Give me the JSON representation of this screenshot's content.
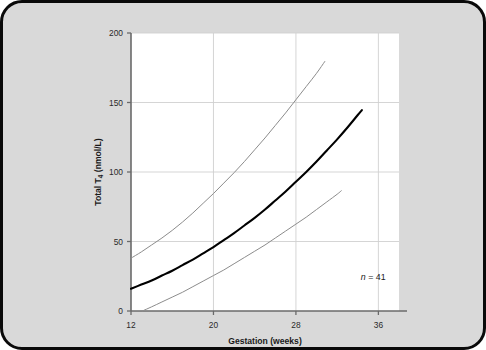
{
  "figure": {
    "background_color": "#d9d9d9",
    "border_color": "#0a0a0a",
    "plot_background_color": "#ffffff"
  },
  "chart_data": {
    "type": "line",
    "title": "",
    "xlabel": "Gestation (weeks)",
    "ylabel_prefix": "Total T",
    "ylabel_sub": "4",
    "ylabel_suffix": " (nmol/L)",
    "ylabel": "Total T4 (nmol/L)",
    "xlim": [
      12,
      38
    ],
    "ylim": [
      0,
      200
    ],
    "xticks": [
      12,
      20,
      28,
      36
    ],
    "xticklabels": [
      "12",
      "20",
      "28",
      "36"
    ],
    "yticks": [
      0,
      50,
      100,
      150,
      200
    ],
    "yticklabels": [
      "0",
      "50",
      "100",
      "150",
      "200"
    ],
    "grid": true,
    "grid_color": "#d0d0d0",
    "legend": "none",
    "annotations": [
      {
        "name": "sample-size",
        "text_italic": "n",
        "text_rest": " = 41",
        "x": 35.5,
        "y": 22
      }
    ],
    "series": [
      {
        "name": "upper-centile",
        "label": "Upper reference limit (97.5th centile)",
        "color": "#8c8c8c",
        "width": 1.0,
        "points": [
          {
            "x": 12.0,
            "y": 38.0
          },
          {
            "x": 13.0,
            "y": 42.5
          },
          {
            "x": 14.0,
            "y": 47.5
          },
          {
            "x": 15.0,
            "y": 52.5
          },
          {
            "x": 16.0,
            "y": 58.0
          },
          {
            "x": 17.0,
            "y": 64.0
          },
          {
            "x": 18.0,
            "y": 70.5
          },
          {
            "x": 19.0,
            "y": 77.5
          },
          {
            "x": 20.0,
            "y": 84.5
          },
          {
            "x": 21.0,
            "y": 92.0
          },
          {
            "x": 22.0,
            "y": 99.5
          },
          {
            "x": 23.0,
            "y": 107.5
          },
          {
            "x": 24.0,
            "y": 116.0
          },
          {
            "x": 25.0,
            "y": 124.5
          },
          {
            "x": 26.0,
            "y": 133.5
          },
          {
            "x": 27.0,
            "y": 142.5
          },
          {
            "x": 28.0,
            "y": 152.0
          },
          {
            "x": 29.0,
            "y": 161.5
          },
          {
            "x": 30.0,
            "y": 171.0
          },
          {
            "x": 30.8,
            "y": 179.5
          }
        ]
      },
      {
        "name": "median",
        "label": "Median (50th centile)",
        "color": "#000000",
        "width": 2.1,
        "points": [
          {
            "x": 12.0,
            "y": 16.0
          },
          {
            "x": 13.0,
            "y": 19.0
          },
          {
            "x": 14.0,
            "y": 22.0
          },
          {
            "x": 15.0,
            "y": 25.5
          },
          {
            "x": 16.0,
            "y": 29.0
          },
          {
            "x": 17.0,
            "y": 33.0
          },
          {
            "x": 18.0,
            "y": 37.0
          },
          {
            "x": 19.0,
            "y": 41.5
          },
          {
            "x": 20.0,
            "y": 46.0
          },
          {
            "x": 21.0,
            "y": 51.0
          },
          {
            "x": 22.0,
            "y": 56.0
          },
          {
            "x": 23.0,
            "y": 61.5
          },
          {
            "x": 24.0,
            "y": 67.0
          },
          {
            "x": 25.0,
            "y": 73.0
          },
          {
            "x": 26.0,
            "y": 79.5
          },
          {
            "x": 27.0,
            "y": 86.0
          },
          {
            "x": 28.0,
            "y": 93.0
          },
          {
            "x": 29.0,
            "y": 100.0
          },
          {
            "x": 30.0,
            "y": 107.5
          },
          {
            "x": 31.0,
            "y": 115.5
          },
          {
            "x": 32.0,
            "y": 123.5
          },
          {
            "x": 33.0,
            "y": 132.0
          },
          {
            "x": 34.0,
            "y": 141.0
          },
          {
            "x": 34.4,
            "y": 144.5
          }
        ]
      },
      {
        "name": "lower-centile",
        "label": "Lower reference limit (2.5th centile)",
        "color": "#8c8c8c",
        "width": 1.0,
        "points": [
          {
            "x": 13.1,
            "y": 0.0
          },
          {
            "x": 14.0,
            "y": 3.0
          },
          {
            "x": 15.0,
            "y": 6.5
          },
          {
            "x": 16.0,
            "y": 10.0
          },
          {
            "x": 17.0,
            "y": 13.5
          },
          {
            "x": 18.0,
            "y": 17.5
          },
          {
            "x": 19.0,
            "y": 21.5
          },
          {
            "x": 20.0,
            "y": 25.5
          },
          {
            "x": 21.0,
            "y": 29.5
          },
          {
            "x": 22.0,
            "y": 34.0
          },
          {
            "x": 23.0,
            "y": 38.5
          },
          {
            "x": 24.0,
            "y": 43.0
          },
          {
            "x": 25.0,
            "y": 47.5
          },
          {
            "x": 26.0,
            "y": 52.5
          },
          {
            "x": 27.0,
            "y": 57.5
          },
          {
            "x": 28.0,
            "y": 62.5
          },
          {
            "x": 29.0,
            "y": 67.5
          },
          {
            "x": 30.0,
            "y": 73.0
          },
          {
            "x": 31.0,
            "y": 78.5
          },
          {
            "x": 32.0,
            "y": 84.0
          },
          {
            "x": 32.4,
            "y": 86.5
          }
        ]
      }
    ]
  }
}
